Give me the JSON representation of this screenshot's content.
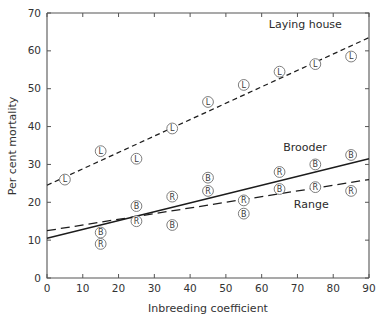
{
  "chart_data": {
    "type": "scatter",
    "title": "",
    "xlabel": "Inbreeding coefficient",
    "ylabel": "Per cent mortality",
    "xlim": [
      0,
      90
    ],
    "ylim": [
      0,
      70
    ],
    "xticks": [
      0,
      10,
      20,
      30,
      40,
      50,
      60,
      70,
      80,
      90
    ],
    "yticks": [
      0,
      10,
      20,
      30,
      40,
      50,
      60,
      70
    ],
    "xtick_labels": [
      "0",
      "10",
      "20",
      "30",
      "40",
      "50",
      "60",
      "70",
      "80",
      "90"
    ],
    "ytick_labels": [
      "0",
      "10",
      "20",
      "30",
      "40",
      "50",
      "60",
      "70"
    ],
    "grid": false,
    "legend_position": "inline-annotations",
    "series": [
      {
        "name": "Laying house",
        "marker": "L",
        "label": "Laying house",
        "label_x": 62,
        "label_y": 66,
        "line_style": "dashed",
        "fit_line": {
          "x": [
            0,
            90
          ],
          "y": [
            24.5,
            63.5
          ]
        },
        "x": [
          5,
          15,
          25,
          35,
          45,
          55,
          65,
          75,
          85
        ],
        "y": [
          26.0,
          33.5,
          31.5,
          39.5,
          46.5,
          51.0,
          54.5,
          56.5,
          58.5
        ]
      },
      {
        "name": "Brooder",
        "marker": "B",
        "label": "Brooder",
        "label_x": 66,
        "label_y": 33.5,
        "line_style": "solid",
        "fit_line": {
          "x": [
            0,
            90
          ],
          "y": [
            10.5,
            31.5
          ]
        },
        "x": [
          15,
          25,
          35,
          45,
          55,
          65,
          75,
          85
        ],
        "y": [
          12.0,
          19.0,
          14.0,
          26.5,
          17.0,
          23.5,
          30.0,
          32.5
        ]
      },
      {
        "name": "Range",
        "marker": "R",
        "label": "Range",
        "label_x": 69,
        "label_y": 18.5,
        "line_style": "long-dashed",
        "fit_line": {
          "x": [
            0,
            90
          ],
          "y": [
            12.5,
            26.0
          ]
        },
        "x": [
          15,
          25,
          35,
          45,
          55,
          65,
          75,
          85
        ],
        "y": [
          9.0,
          15.0,
          21.5,
          23.0,
          20.5,
          28.0,
          24.0,
          23.0
        ]
      }
    ]
  },
  "colors": {
    "axis": "#555555",
    "trend_line": "#1c1c1c",
    "marker_stroke": "#6e6e6e",
    "marker_fill": "#ffffff",
    "text": "#333333",
    "background": "#ffffff"
  }
}
